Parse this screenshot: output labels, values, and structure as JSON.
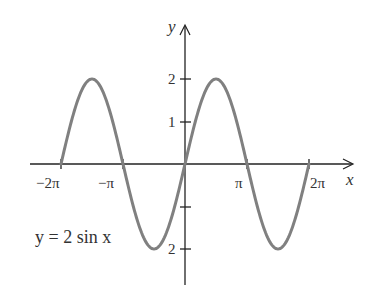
{
  "chart_data": {
    "type": "line",
    "title": "",
    "equation_label": "y = 2 sin x",
    "xlabel": "x",
    "ylabel": "y",
    "x_ticks": [
      "-2π",
      "-π",
      "π",
      "2π"
    ],
    "y_ticks": [
      "2",
      "1",
      "",
      "-2"
    ],
    "x_range": [
      -6.2832,
      6.2832
    ],
    "ylim": [
      -2,
      2
    ],
    "grid": false,
    "series": [
      {
        "name": "y = 2 sin x",
        "function": "2*sin(x)",
        "color": "#808080",
        "x": [
          -6.2832,
          -4.7124,
          -3.1416,
          -1.5708,
          0,
          1.5708,
          3.1416,
          4.7124,
          6.2832
        ],
        "values": [
          0,
          2,
          0,
          -2,
          0,
          2,
          0,
          -2,
          0
        ]
      }
    ]
  },
  "labels": {
    "y_axis": "y",
    "x_axis": "x",
    "tick_neg2pi": "−2π",
    "tick_negpi": "−π",
    "tick_pi": "π",
    "tick_2pi": "2π",
    "tick_y2": "2",
    "tick_y1": "1",
    "tick_yneg2": "2",
    "equation": "y = 2 sin x"
  },
  "colors": {
    "curve": "#808080",
    "axis": "#222222"
  }
}
